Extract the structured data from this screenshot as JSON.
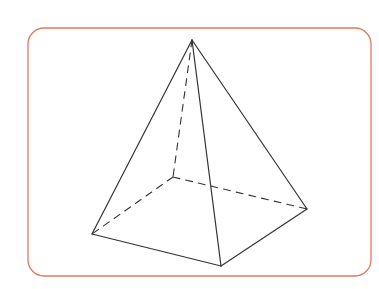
{
  "diagram": {
    "colors": {
      "background": "#ffffff",
      "frame": "#e07a5f",
      "edge": "#333333"
    },
    "frame": {
      "x": 28,
      "y": 28,
      "width": 343,
      "height": 248,
      "radius": 16
    },
    "vertices": {
      "apex": [
        192,
        40
      ],
      "base_left": [
        92,
        234
      ],
      "base_front": [
        221,
        266
      ],
      "base_right": [
        307,
        209
      ],
      "base_back": [
        173,
        177
      ]
    },
    "visible_edges": [
      [
        "apex",
        "base_left"
      ],
      [
        "apex",
        "base_front"
      ],
      [
        "apex",
        "base_right"
      ],
      [
        "base_left",
        "base_front"
      ],
      [
        "base_front",
        "base_right"
      ]
    ],
    "hidden_edges": [
      [
        "apex",
        "base_back"
      ],
      [
        "base_back",
        "base_left"
      ],
      [
        "base_back",
        "base_right"
      ]
    ]
  }
}
